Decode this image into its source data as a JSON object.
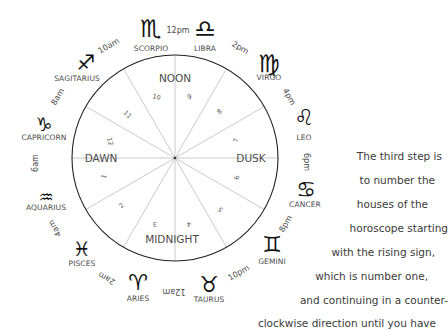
{
  "wheel": {
    "quarters": {
      "top": "NOON",
      "left": "DAWN",
      "right": "DUSK",
      "bottom": "MIDNIGHT"
    },
    "houses": [
      "1",
      "2",
      "3",
      "4",
      "5",
      "6",
      "7",
      "8",
      "9",
      "10",
      "11",
      "12"
    ],
    "signs": [
      {
        "name": "SCORPIO",
        "glyph": "♏"
      },
      {
        "name": "LIBRA",
        "glyph": "♎"
      },
      {
        "name": "VIRGO",
        "glyph": "♍"
      },
      {
        "name": "LEO",
        "glyph": "♌"
      },
      {
        "name": "CANCER",
        "glyph": "♋"
      },
      {
        "name": "GEMINI",
        "glyph": "♊"
      },
      {
        "name": "TAURUS",
        "glyph": "♉"
      },
      {
        "name": "ARIES",
        "glyph": "♈"
      },
      {
        "name": "PISCES",
        "glyph": "♓"
      },
      {
        "name": "AQUARIUS",
        "glyph": "♒"
      },
      {
        "name": "CAPRICORN",
        "glyph": "♑"
      },
      {
        "name": "SAGITARIUS",
        "glyph": "♐"
      }
    ],
    "times": [
      "12pm",
      "2pm",
      "4pm",
      "6pm",
      "8pm",
      "10pm",
      "12am",
      "2am",
      "4am",
      "6am",
      "8am",
      "10am"
    ]
  },
  "caption": {
    "lines": [
      "The third step is",
      "to number the",
      "houses of the",
      "horoscope starting",
      "with the rising sign,",
      "which is number one,",
      "and continuing in a counter-",
      "clockwise direction until you have"
    ]
  }
}
